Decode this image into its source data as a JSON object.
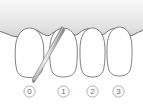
{
  "illustration": {
    "title": "Periodontal probing diagram",
    "background_color": "#ffffff",
    "gum": {
      "name": "gingiva",
      "fill_top": "#f2f2f2",
      "fill_bottom": "#d7d7d7",
      "outline_color": "#5a5a5a"
    },
    "tooth_outline_color": "#6b6b6b",
    "tooth_fill": "#ffffff",
    "probe": {
      "name": "periodontal-probe",
      "body_color": "#8a8a8a",
      "highlight_color": "#d0d0d0",
      "inserted_at_tooth": "1"
    }
  },
  "teeth": [
    {
      "index": 0,
      "label": "0",
      "cx": 29.5
    },
    {
      "index": 1,
      "label": "1",
      "cx": 63.5
    },
    {
      "index": 2,
      "label": "2",
      "cx": 92.5
    },
    {
      "index": 3,
      "label": "3",
      "cx": 118.5
    }
  ],
  "labels": {
    "circle_stroke": "#9a9a9a",
    "text_color": "#6d6d6d",
    "values": [
      "0",
      "1",
      "2",
      "3"
    ]
  }
}
